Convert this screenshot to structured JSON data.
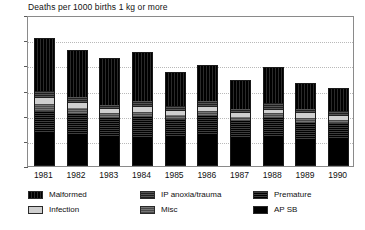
{
  "chart_data": {
    "type": "bar",
    "subtype": "stacked-bar",
    "title": "Deaths per 1000 births 1 kg or more",
    "xlabel": "",
    "ylabel": "",
    "ylim": [
      0,
      12
    ],
    "yticks": [
      0,
      2,
      4,
      6,
      8,
      10,
      12
    ],
    "grid": true,
    "grid_axis": "y",
    "legend_position": "bottom",
    "categories": [
      "1981",
      "1982",
      "1983",
      "1984",
      "1985",
      "1986",
      "1987",
      "1988",
      "1989",
      "1990"
    ],
    "series": [
      {
        "name": "AP SB",
        "color": "#000000",
        "values": [
          2.6,
          2.4,
          2.3,
          2.2,
          2.3,
          2.4,
          2.2,
          2.3,
          2.0,
          2.1
        ]
      },
      {
        "name": "Premature",
        "color": "#2b2b2b",
        "values": [
          1.8,
          1.7,
          1.5,
          1.7,
          1.4,
          1.6,
          1.4,
          1.5,
          1.4,
          1.3
        ]
      },
      {
        "name": "Misc",
        "color": "#5e5e5e",
        "values": [
          0.5,
          0.5,
          0.4,
          0.4,
          0.4,
          0.4,
          0.3,
          0.4,
          0.4,
          0.3
        ]
      },
      {
        "name": "Infection",
        "color": "#cfcfcf",
        "values": [
          0.5,
          0.4,
          0.3,
          0.4,
          0.3,
          0.3,
          0.3,
          0.3,
          0.4,
          0.3
        ]
      },
      {
        "name": "IP anoxia/trauma",
        "color": "#3a3a3a",
        "values": [
          0.6,
          0.5,
          0.4,
          0.5,
          0.4,
          0.5,
          0.4,
          0.5,
          0.4,
          0.4
        ]
      },
      {
        "name": "Malformed",
        "color": "#111111",
        "values": [
          4.2,
          3.7,
          3.7,
          3.9,
          2.7,
          2.8,
          2.2,
          2.9,
          2.0,
          1.8
        ]
      }
    ],
    "totals": [
      10.2,
      9.2,
      8.6,
      9.1,
      7.5,
      8.0,
      6.8,
      7.9,
      6.6,
      6.2
    ]
  },
  "legend": {
    "entries": [
      {
        "label": "Malformed",
        "swatch": "fill-malformed"
      },
      {
        "label": "Infection",
        "swatch": "fill-infection"
      },
      {
        "label": "IP anoxia/trauma",
        "swatch": "fill-anoxia"
      },
      {
        "label": "Misc",
        "swatch": "fill-misc"
      },
      {
        "label": "Premature",
        "swatch": "fill-premature"
      },
      {
        "label": "AP SB",
        "swatch": "fill-apsb"
      }
    ]
  }
}
